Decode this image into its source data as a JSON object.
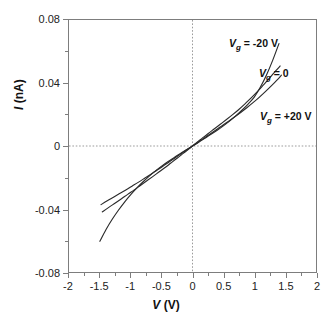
{
  "chart_data": {
    "type": "line",
    "title": "",
    "xlabel": "V (V)",
    "ylabel": "I (nA)",
    "xlabel_symbol": "V",
    "xlabel_unit": "(V)",
    "ylabel_symbol": "I",
    "ylabel_unit": "(nA)",
    "xlim": [
      -2,
      2
    ],
    "ylim": [
      -0.08,
      0.08
    ],
    "xticks": [
      -2,
      -1.5,
      -1,
      -0.5,
      0,
      0.5,
      1,
      1.5,
      2
    ],
    "xtick_labels": [
      "-2",
      "-1.5",
      "-1",
      "-0.5",
      "0",
      "0.5",
      "1",
      "1.5",
      "2"
    ],
    "yticks": [
      -0.08,
      -0.06,
      -0.04,
      -0.02,
      0,
      0.02,
      0.04,
      0.06,
      0.08
    ],
    "ytick_labels": [
      "-0.08",
      "",
      "-0.04",
      "",
      "0",
      "",
      "0.04",
      "",
      "0.08"
    ],
    "ytick_major": [
      -0.08,
      -0.04,
      0,
      0.04,
      0.08
    ],
    "grid": false,
    "zero_lines": {
      "x": 0,
      "y": 0,
      "style": "dotted",
      "color": "#9a9a9a"
    },
    "legend_position": "inside-right",
    "line_color": "#2b2b2b",
    "series": [
      {
        "name": "Vg = -20 V",
        "label_symbol": "V",
        "label_sub": "g",
        "label_rest": " = -20 V",
        "x": [
          -1.5,
          -1.4,
          -1.3,
          -1.2,
          -1.1,
          -1.0,
          -0.9,
          -0.8,
          -0.7,
          -0.6,
          -0.5,
          -0.4,
          -0.3,
          -0.2,
          -0.1,
          0.0,
          0.1,
          0.2,
          0.3,
          0.4,
          0.5,
          0.6,
          0.7,
          0.8,
          0.9,
          1.0,
          1.1,
          1.2,
          1.3,
          1.4
        ],
        "y": [
          -0.0605,
          -0.053,
          -0.0465,
          -0.0408,
          -0.0356,
          -0.0309,
          -0.0266,
          -0.0227,
          -0.0191,
          -0.0158,
          -0.0128,
          -0.01,
          -0.0074,
          -0.0049,
          -0.0024,
          0.0,
          0.0024,
          0.0049,
          0.0074,
          0.01,
          0.0128,
          0.0158,
          0.0191,
          0.0227,
          0.0266,
          0.031,
          0.0374,
          0.0452,
          0.0545,
          0.065
        ]
      },
      {
        "name": "Vg = 0",
        "label_symbol": "V",
        "label_sub": "g",
        "label_rest": " = 0",
        "x": [
          -1.46,
          -1.35,
          -1.25,
          -1.15,
          -1.05,
          -0.95,
          -0.85,
          -0.75,
          -0.65,
          -0.55,
          -0.45,
          -0.35,
          -0.25,
          -0.15,
          -0.05,
          0.0,
          0.05,
          0.15,
          0.25,
          0.35,
          0.45,
          0.55,
          0.65,
          0.75,
          0.85,
          0.95,
          1.05,
          1.15,
          1.25,
          1.35,
          1.42
        ],
        "y": [
          -0.0418,
          -0.0388,
          -0.0362,
          -0.0335,
          -0.0307,
          -0.028,
          -0.0252,
          -0.0224,
          -0.0196,
          -0.0167,
          -0.0138,
          -0.0108,
          -0.0078,
          -0.0047,
          -0.0016,
          0.0,
          0.0016,
          0.0047,
          0.0078,
          0.0108,
          0.0138,
          0.0168,
          0.0199,
          0.0232,
          0.0268,
          0.0305,
          0.0345,
          0.0388,
          0.0432,
          0.0478,
          0.0508
        ]
      },
      {
        "name": "Vg = +20 V",
        "label_symbol": "V",
        "label_sub": "g",
        "label_rest": " = +20 V",
        "x": [
          -1.48,
          -1.38,
          -1.28,
          -1.18,
          -1.08,
          -0.98,
          -0.88,
          -0.78,
          -0.68,
          -0.58,
          -0.48,
          -0.38,
          -0.28,
          -0.18,
          -0.08,
          0.0,
          0.08,
          0.18,
          0.28,
          0.38,
          0.48,
          0.58,
          0.68,
          0.78,
          0.88,
          0.98,
          1.08,
          1.18,
          1.28,
          1.38,
          1.44
        ],
        "y": [
          -0.0372,
          -0.0348,
          -0.0325,
          -0.0302,
          -0.0279,
          -0.0255,
          -0.0231,
          -0.0206,
          -0.0181,
          -0.0155,
          -0.0129,
          -0.0102,
          -0.0075,
          -0.0048,
          -0.0021,
          0.0,
          0.0021,
          0.0048,
          0.0075,
          0.0102,
          0.0129,
          0.0156,
          0.0184,
          0.0213,
          0.0243,
          0.0275,
          0.0309,
          0.0345,
          0.0383,
          0.0423,
          0.045
        ]
      }
    ]
  }
}
